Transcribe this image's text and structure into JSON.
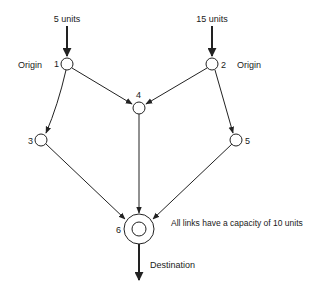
{
  "diagram": {
    "type": "network-flow",
    "note": "All links have a capacity of 10 units",
    "nodes": [
      {
        "id": "1",
        "label": "1",
        "role": "Origin",
        "supply": "5 units",
        "x": 67,
        "y": 64
      },
      {
        "id": "2",
        "label": "2",
        "role": "Origin",
        "supply": "15 units",
        "x": 212,
        "y": 64
      },
      {
        "id": "3",
        "label": "3",
        "x": 41,
        "y": 140
      },
      {
        "id": "4",
        "label": "4",
        "x": 139,
        "y": 108
      },
      {
        "id": "5",
        "label": "5",
        "x": 236,
        "y": 140
      },
      {
        "id": "6",
        "label": "6",
        "role": "Destination",
        "x": 139,
        "y": 229
      }
    ],
    "edges": [
      {
        "from": "1",
        "to": "3"
      },
      {
        "from": "1",
        "to": "4"
      },
      {
        "from": "2",
        "to": "4"
      },
      {
        "from": "2",
        "to": "5"
      },
      {
        "from": "3",
        "to": "6"
      },
      {
        "from": "4",
        "to": "6"
      },
      {
        "from": "5",
        "to": "6"
      }
    ],
    "labels": {
      "supply_1": "5 units",
      "supply_2": "15 units",
      "origin_1": "Origin",
      "origin_2": "Origin",
      "node_1": "1",
      "node_2": "2",
      "node_3": "3",
      "node_4": "4",
      "node_5": "5",
      "node_6": "6",
      "destination": "Destination",
      "capacity_note": "All links have a capacity of 10 units"
    }
  }
}
